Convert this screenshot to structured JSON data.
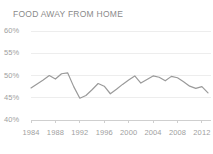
{
  "chart_data": {
    "type": "line",
    "title": "FOOD AWAY FROM HOME",
    "xlabel": "",
    "ylabel": "",
    "ylim": [
      40,
      60
    ],
    "xlim": [
      1984,
      2013
    ],
    "grid": true,
    "legend": false,
    "line_color": "#9a9a9a",
    "axis_color": "#cfcfcf",
    "grid_color": "#ededed",
    "text_color": "#a0a0a0",
    "title_color": "#8a8a8a",
    "y_ticks": [
      "40%",
      "45%",
      "50%",
      "55%",
      "60%"
    ],
    "y_tick_values": [
      40,
      45,
      50,
      55,
      60
    ],
    "x_ticks": [
      "1984",
      "1988",
      "1992",
      "1996",
      "2000",
      "2004",
      "2008",
      "2012"
    ],
    "x_tick_values": [
      1984,
      1988,
      1992,
      1996,
      2000,
      2004,
      2008,
      2012
    ],
    "x": [
      1984,
      1985,
      1986,
      1987,
      1988,
      1989,
      1990,
      1991,
      1992,
      1993,
      1994,
      1995,
      1996,
      1997,
      1998,
      1999,
      2000,
      2001,
      2002,
      2003,
      2004,
      2005,
      2006,
      2007,
      2008,
      2009,
      2010,
      2011,
      2012,
      2013
    ],
    "values": [
      47.2,
      48.1,
      49.0,
      50.0,
      49.2,
      50.4,
      50.6,
      47.5,
      44.9,
      45.5,
      46.8,
      48.2,
      47.6,
      45.9,
      46.9,
      48.0,
      49.0,
      49.9,
      48.3,
      49.1,
      49.9,
      49.6,
      48.8,
      49.8,
      49.5,
      48.6,
      47.6,
      47.1,
      47.5,
      46.1
    ],
    "series_name": "Food away from home share"
  }
}
